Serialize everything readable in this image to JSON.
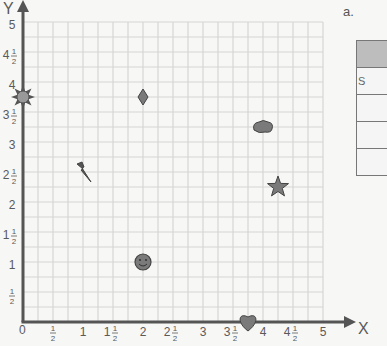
{
  "chart_data": {
    "type": "scatter",
    "title": "",
    "xlabel": "X",
    "ylabel": "Y",
    "xlim": [
      0,
      5
    ],
    "ylim": [
      0,
      5
    ],
    "grid": true,
    "grid_step": 0.25,
    "x_ticks": [
      "0",
      "1/2",
      "1",
      "1 1/2",
      "2",
      "2 1/2",
      "3",
      "3 1/2",
      "4",
      "4 1/2",
      "5"
    ],
    "y_ticks": [
      "1/2",
      "1",
      "1 1/2",
      "2",
      "2 1/2",
      "3",
      "3 1/2",
      "4",
      "4 1/2",
      "5"
    ],
    "points": [
      {
        "shape": "sun",
        "x": 0,
        "y": 3.75
      },
      {
        "shape": "diamond",
        "x": 2,
        "y": 3.75
      },
      {
        "shape": "cloud",
        "x": 4,
        "y": 3.25
      },
      {
        "shape": "lightning",
        "x": 1,
        "y": 2.5
      },
      {
        "shape": "star",
        "x": 4.25,
        "y": 2.25
      },
      {
        "shape": "smiley",
        "x": 2,
        "y": 1
      },
      {
        "shape": "heart",
        "x": 3.75,
        "y": 0
      }
    ]
  },
  "axes": {
    "x_label": "X",
    "y_label": "Y",
    "origin_label": "0",
    "x_tick_labels": [
      {
        "whole": "",
        "num": "1",
        "den": "2"
      },
      {
        "whole": "1",
        "num": "",
        "den": ""
      },
      {
        "whole": "1",
        "num": "1",
        "den": "2"
      },
      {
        "whole": "2",
        "num": "",
        "den": ""
      },
      {
        "whole": "2",
        "num": "1",
        "den": "2"
      },
      {
        "whole": "3",
        "num": "",
        "den": ""
      },
      {
        "whole": "3",
        "num": "1",
        "den": "2"
      },
      {
        "whole": "4",
        "num": "",
        "den": ""
      },
      {
        "whole": "4",
        "num": "1",
        "den": "2"
      },
      {
        "whole": "5",
        "num": "",
        "den": ""
      }
    ],
    "y_tick_labels": [
      {
        "whole": "",
        "num": "1",
        "den": "2"
      },
      {
        "whole": "1",
        "num": "",
        "den": ""
      },
      {
        "whole": "1",
        "num": "1",
        "den": "2"
      },
      {
        "whole": "2",
        "num": "",
        "den": ""
      },
      {
        "whole": "2",
        "num": "1",
        "den": "2"
      },
      {
        "whole": "3",
        "num": "",
        "den": ""
      },
      {
        "whole": "3",
        "num": "1",
        "den": "2"
      },
      {
        "whole": "4",
        "num": "",
        "den": ""
      },
      {
        "whole": "4",
        "num": "1",
        "den": "2"
      },
      {
        "whole": "5",
        "num": "",
        "den": ""
      }
    ]
  },
  "side_panel": {
    "label": "a.",
    "table_rows": [
      "S",
      "",
      "",
      ""
    ]
  },
  "colors": {
    "grid": "#d6d6d6",
    "axis": "#555555",
    "shape_fill": "#7a7a7a",
    "shape_stroke": "#444444",
    "table_header": "#bdbdbd"
  }
}
